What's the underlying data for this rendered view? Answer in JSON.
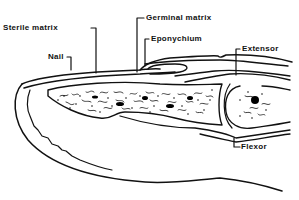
{
  "diagram": {
    "labels": {
      "sterile_matrix": "Sterile matrix",
      "germinal_matrix": "Germinal matrix",
      "nail": "Nail",
      "eponychium": "Eponychium",
      "extensor": "Extensor",
      "flexor": "Flexor"
    },
    "colors": {
      "ink": "#111111",
      "background": "#ffffff"
    }
  }
}
